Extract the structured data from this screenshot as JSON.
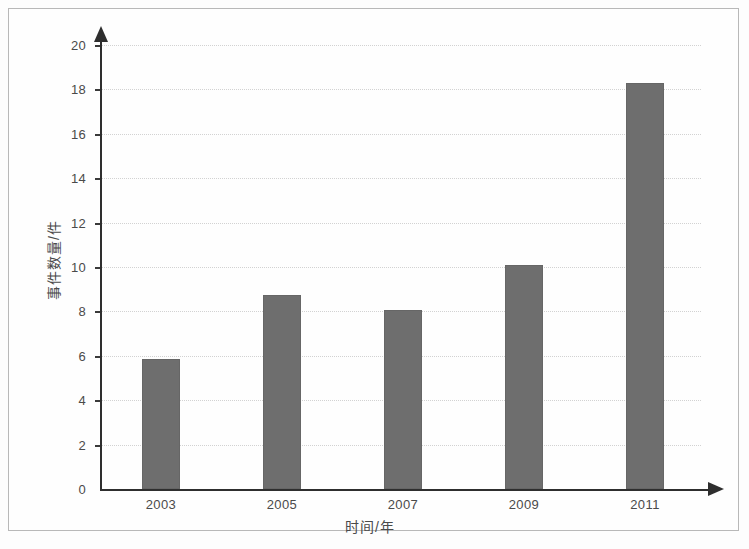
{
  "chart_data": {
    "type": "bar",
    "title": "",
    "subtitle": "",
    "xlabel": "时间/年",
    "ylabel": "事件数量/件",
    "categories": [
      "2003",
      "2005",
      "2007",
      "2009",
      "2011"
    ],
    "values": [
      5.85,
      8.75,
      8.05,
      10.1,
      18.3
    ],
    "series": [
      {
        "name": "事件数量",
        "values": [
          5.85,
          8.75,
          8.05,
          10.1,
          18.3
        ]
      }
    ],
    "ylim": [
      0,
      20
    ],
    "xlim_categories": 5,
    "y_ticks": [
      0,
      2,
      4,
      6,
      8,
      10,
      12,
      14,
      16,
      18,
      20
    ],
    "y_tick_labels": [
      "0",
      "2",
      "4",
      "6",
      "8",
      "10",
      "12",
      "14",
      "16",
      "18",
      "20"
    ],
    "grid": true,
    "grid_axis": "y",
    "grid_style": "dotted",
    "legend": false,
    "legend_position": "none",
    "bar_color": "#6e6e6e",
    "axis_color": "#2e2e2e",
    "grid_color": "#d2d2d2",
    "text_color": "#4a4a4a",
    "background_color": "#fefefe",
    "border_color": "#b8b8b8",
    "y_axis_has_arrow": true,
    "x_axis_has_arrow": true,
    "annotations": []
  }
}
